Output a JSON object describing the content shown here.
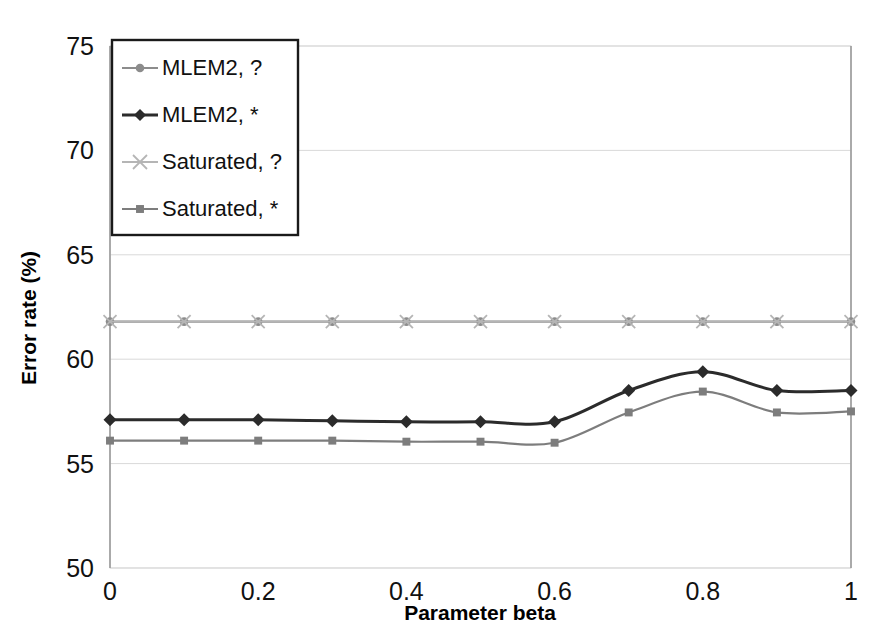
{
  "chart_data": {
    "type": "line",
    "title": "",
    "xlabel": "Parameter beta",
    "ylabel": "Error rate (%)",
    "xlim": [
      0,
      1
    ],
    "ylim": [
      50,
      75
    ],
    "xticks": [
      "0",
      "0.2",
      "0.4",
      "0.6",
      "0.8",
      "1"
    ],
    "xtick_values": [
      0,
      0.2,
      0.4,
      0.6,
      0.8,
      1
    ],
    "yticks": [
      "50",
      "55",
      "60",
      "65",
      "70",
      "75"
    ],
    "ytick_values": [
      50,
      55,
      60,
      65,
      70,
      75
    ],
    "grid": true,
    "legend_position": "top-left",
    "x": [
      0,
      0.1,
      0.2,
      0.3,
      0.4,
      0.5,
      0.6,
      0.7,
      0.8,
      0.9,
      1
    ],
    "series": [
      {
        "name": "MLEM2, ?",
        "marker": "circle",
        "color": "#8c8c8c",
        "values": [
          61.8,
          61.8,
          61.8,
          61.8,
          61.8,
          61.8,
          61.8,
          61.8,
          61.8,
          61.8,
          61.8
        ]
      },
      {
        "name": "MLEM2, *",
        "marker": "diamond",
        "color": "#2b2b2b",
        "values": [
          57.1,
          57.1,
          57.1,
          57.05,
          57.0,
          57.0,
          57.0,
          58.5,
          59.4,
          58.5,
          58.5
        ]
      },
      {
        "name": "Saturated, ?",
        "marker": "cross",
        "color": "#b5b5b5",
        "values": [
          61.8,
          61.8,
          61.8,
          61.8,
          61.8,
          61.8,
          61.8,
          61.8,
          61.8,
          61.8,
          61.8
        ]
      },
      {
        "name": "Saturated, *",
        "marker": "square",
        "color": "#7d7d7d",
        "values": [
          56.1,
          56.1,
          56.1,
          56.1,
          56.05,
          56.05,
          56.0,
          57.45,
          58.45,
          57.45,
          57.5
        ]
      }
    ]
  },
  "legend": {
    "entries": [
      {
        "label": "MLEM2, ?"
      },
      {
        "label": "MLEM2, *"
      },
      {
        "label": "Saturated, ?"
      },
      {
        "label": "Saturated, *"
      }
    ]
  },
  "axes": {
    "y_title": "Error rate (%)",
    "x_title": "Parameter beta"
  }
}
